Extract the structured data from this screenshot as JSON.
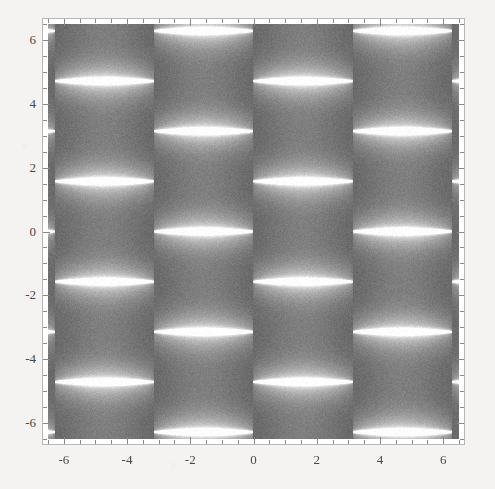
{
  "figure": {
    "kind": "density-plot",
    "background_color": "#f4f3f1",
    "frame_color": "#b9b7b3",
    "tick_color": "#8a8884",
    "label_color": "#4a4844"
  },
  "chart_data": {
    "type": "heatmap",
    "title": "",
    "subtitle": "",
    "xlabel": "",
    "ylabel": "",
    "xlim": [
      -6.5,
      6.5
    ],
    "ylim": [
      -6.5,
      6.5
    ],
    "grid": false,
    "legend": null,
    "colormap": "grayscale",
    "colormap_low": "#3c3c3c",
    "colormap_high": "#ffffff",
    "x_major_ticks": [
      -6,
      -4,
      -2,
      0,
      2,
      4,
      6
    ],
    "x_major_tick_labels": [
      "-6",
      "-4",
      "-2",
      "0",
      "2",
      "4",
      "6"
    ],
    "y_major_ticks": [
      -6,
      -4,
      -2,
      0,
      2,
      4,
      6
    ],
    "y_major_tick_labels": [
      "6",
      "4",
      "2",
      "0",
      "-2",
      "-4",
      "-6"
    ],
    "minor_ticks_per_interval": 4,
    "x_minor_step": 0.5,
    "y_minor_step": 0.5,
    "period_x": 3.14159,
    "period_y": 3.14159,
    "bright_band_y_values": [
      -4.712,
      -1.571,
      1.571,
      4.712
    ],
    "cell_boundaries_x": [
      -6.283,
      -3.142,
      0,
      3.142,
      6.283
    ],
    "noise": true,
    "value_range": [
      0,
      1
    ]
  }
}
